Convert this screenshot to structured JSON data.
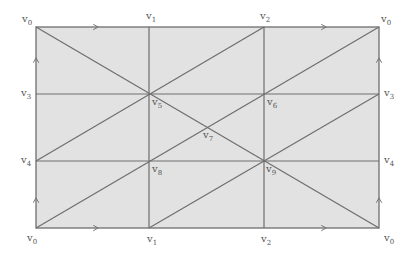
{
  "diagram": {
    "title": "",
    "colors": {
      "fill": "#e2e2e2",
      "line": "#6e6e6e",
      "label": "#555555"
    },
    "vertices": {
      "v0_tl": {
        "label": "v",
        "sub": "0",
        "x": 36,
        "y": 27
      },
      "v1_t": {
        "label": "v",
        "sub": "1",
        "x": 149,
        "y": 27
      },
      "v2_t": {
        "label": "v",
        "sub": "2",
        "x": 264,
        "y": 27
      },
      "v0_tr": {
        "label": "v",
        "sub": "0",
        "x": 379,
        "y": 27
      },
      "v3_l": {
        "label": "v",
        "sub": "3",
        "x": 36,
        "y": 94
      },
      "v5": {
        "label": "v",
        "sub": "5",
        "x": 149,
        "y": 94
      },
      "v6": {
        "label": "v",
        "sub": "6",
        "x": 264,
        "y": 94
      },
      "v3_r": {
        "label": "v",
        "sub": "3",
        "x": 379,
        "y": 94
      },
      "v7": {
        "label": "v",
        "sub": "7",
        "x": 206,
        "y": 128
      },
      "v4_l": {
        "label": "v",
        "sub": "4",
        "x": 36,
        "y": 161
      },
      "v8": {
        "label": "v",
        "sub": "8",
        "x": 149,
        "y": 161
      },
      "v9": {
        "label": "v",
        "sub": "9",
        "x": 264,
        "y": 161
      },
      "v4_r": {
        "label": "v",
        "sub": "4",
        "x": 379,
        "y": 161
      },
      "v0_bl": {
        "label": "v",
        "sub": "0",
        "x": 36,
        "y": 228
      },
      "v1_b": {
        "label": "v",
        "sub": "1",
        "x": 149,
        "y": 228
      },
      "v2_b": {
        "label": "v",
        "sub": "2",
        "x": 264,
        "y": 228
      },
      "v0_br": {
        "label": "v",
        "sub": "0",
        "x": 379,
        "y": 228
      }
    }
  }
}
